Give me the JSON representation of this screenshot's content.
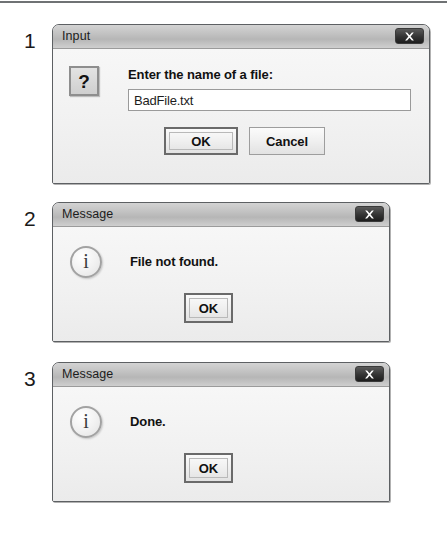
{
  "figure": {
    "steps": [
      {
        "number": "1"
      },
      {
        "number": "2"
      },
      {
        "number": "3"
      }
    ]
  },
  "dialog_input": {
    "title": "Input",
    "close_icon": "close-icon",
    "icon": "question-mark-icon",
    "icon_glyph": "?",
    "prompt": "Enter the name of a file:",
    "input_value": "BadFile.txt",
    "input_placeholder": "",
    "buttons": [
      {
        "label": "OK",
        "default": true
      },
      {
        "label": "Cancel",
        "default": false
      }
    ]
  },
  "dialog_message_1": {
    "title": "Message",
    "close_icon": "close-icon",
    "icon": "info-icon",
    "icon_glyph": "i",
    "message": "File not found.",
    "buttons": [
      {
        "label": "OK",
        "default": true
      }
    ]
  },
  "dialog_message_2": {
    "title": "Message",
    "close_icon": "close-icon",
    "icon": "info-icon",
    "icon_glyph": "i",
    "message": "Done.",
    "buttons": [
      {
        "label": "OK",
        "default": true
      }
    ]
  },
  "colors": {
    "titlebar_top": "#d3d3d3",
    "titlebar_bottom": "#b6b6b6",
    "dialog_body": "#f2f2f2",
    "dialog_border": "#5d6063",
    "close_button": "#2a2a2a",
    "text": "#111111",
    "rule": "#6f7274"
  }
}
